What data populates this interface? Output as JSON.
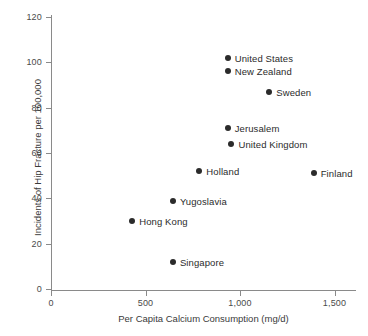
{
  "chart_data": {
    "type": "scatter",
    "title": "",
    "xlabel": "Per Capita Calcium Consumption (mg/d)",
    "ylabel": "Incidents of Hip Fracture per 100,000",
    "xlim": [
      0,
      1620
    ],
    "ylim": [
      0,
      120
    ],
    "xticks": [
      0,
      500,
      1000,
      1500
    ],
    "xtick_labels": [
      "0",
      "500",
      "1,000",
      "1,500"
    ],
    "yticks": [
      0,
      20,
      40,
      60,
      80,
      100,
      120
    ],
    "ytick_labels": [
      "0",
      "20",
      "40",
      "60",
      "80",
      "100",
      "120"
    ],
    "grid": false,
    "legend": "none",
    "marker_color": "#2b2b2b",
    "axis_color": "#8a8a8a",
    "points": [
      {
        "label": "United States",
        "x": 935,
        "y": 102,
        "label_side": "right"
      },
      {
        "label": "New Zealand",
        "x": 935,
        "y": 96,
        "label_side": "right"
      },
      {
        "label": "Sweden",
        "x": 1155,
        "y": 87,
        "label_side": "right"
      },
      {
        "label": "Jerusalem",
        "x": 935,
        "y": 71,
        "label_side": "right"
      },
      {
        "label": "United Kingdom",
        "x": 955,
        "y": 64,
        "label_side": "right"
      },
      {
        "label": "Holland",
        "x": 785,
        "y": 52,
        "label_side": "right"
      },
      {
        "label": "Finland",
        "x": 1390,
        "y": 51,
        "label_side": "right"
      },
      {
        "label": "Yugoslavia",
        "x": 645,
        "y": 39,
        "label_side": "right"
      },
      {
        "label": "Hong Kong",
        "x": 430,
        "y": 30,
        "label_side": "right"
      },
      {
        "label": "Singapore",
        "x": 645,
        "y": 12,
        "label_side": "right"
      }
    ]
  }
}
